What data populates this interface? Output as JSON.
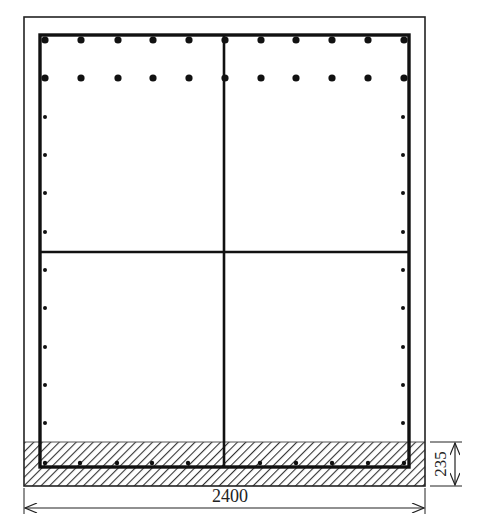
{
  "diagram": {
    "type": "reinforced-concrete-cross-section",
    "colors": {
      "line": "#111111",
      "outline": "#222222",
      "hatch": "#333333",
      "background": "#ffffff"
    },
    "section": {
      "outer": {
        "x": 24,
        "y": 17,
        "w": 401,
        "h": 469
      },
      "stirrup_frame": {
        "x": 40,
        "y": 35,
        "w": 369,
        "h": 432
      },
      "cross_tie_vertical_x": 224,
      "cross_tie_horizontal_y": 252,
      "hatched_band": {
        "y_top": 442,
        "y_bottom": 486
      }
    },
    "rebar": {
      "top_row": {
        "y": 40,
        "radius": 3.6,
        "x": [
          45,
          81,
          118,
          153,
          189,
          225,
          261,
          296,
          332,
          368,
          404
        ]
      },
      "second_row": {
        "y": 78,
        "radius": 3.6,
        "x": [
          45,
          81,
          118,
          153,
          189,
          225,
          261,
          296,
          332,
          368,
          404
        ]
      },
      "left_side": {
        "x": 45,
        "radius": 2.0,
        "y": [
          117,
          155,
          193,
          232,
          270,
          308,
          347,
          385,
          423
        ]
      },
      "right_side": {
        "x": 403,
        "radius": 2.0,
        "y": [
          117,
          155,
          193,
          232,
          270,
          308,
          347,
          385,
          423
        ]
      },
      "bottom_row": {
        "y": 463,
        "radius": 2.2,
        "x": [
          45,
          80,
          117,
          152,
          188,
          260,
          296,
          332,
          368,
          404
        ]
      }
    },
    "dimensions": {
      "width": {
        "label": "2400",
        "x1": 24,
        "x2": 425,
        "y": 508,
        "text_x": 230,
        "text_y": 502
      },
      "bottom_depth": {
        "label": "235",
        "x": 449,
        "y1": 442,
        "y2": 486,
        "text_x": 441,
        "text_y": 464
      }
    }
  }
}
